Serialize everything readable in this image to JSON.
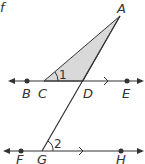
{
  "diagram": {
    "type": "geometry",
    "colors": {
      "stroke": "#333333",
      "fill_triangle": "#d9d9d9",
      "text": "#333333"
    },
    "top_fragment": "f",
    "points": {
      "A": {
        "label": "A",
        "x": 120,
        "y": 16
      },
      "B": {
        "label": "B",
        "x": 27,
        "y": 81
      },
      "C": {
        "label": "C",
        "x": 44,
        "y": 81
      },
      "D": {
        "label": "D",
        "x": 83,
        "y": 81
      },
      "E": {
        "label": "E",
        "x": 127,
        "y": 81
      },
      "F": {
        "label": "F",
        "x": 21,
        "y": 151
      },
      "G": {
        "label": "G",
        "x": 42,
        "y": 151
      },
      "H": {
        "label": "H",
        "x": 121,
        "y": 151
      }
    },
    "angles": {
      "angle1": {
        "label": "1",
        "vertex": "C"
      },
      "angle2": {
        "label": "2",
        "vertex": "G"
      }
    },
    "lines": [
      {
        "name": "line-BE",
        "through": [
          "B",
          "C",
          "D",
          "E"
        ],
        "parallel_mark": true
      },
      {
        "name": "line-FH",
        "through": [
          "F",
          "G",
          "H"
        ],
        "parallel_mark": true
      },
      {
        "name": "transversal-AG",
        "through": [
          "A",
          "D",
          "G"
        ]
      },
      {
        "name": "segment-AC",
        "through": [
          "A",
          "C"
        ]
      }
    ],
    "shaded_region": "triangle ACD"
  }
}
